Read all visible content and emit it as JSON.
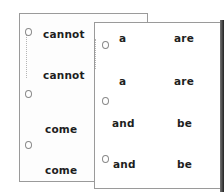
{
  "sheets": {
    "back": {
      "cards": [
        {
          "word": "cannot"
        },
        {
          "word": "cannot"
        },
        {
          "word": "come"
        },
        {
          "word": "come"
        }
      ]
    },
    "front": {
      "cards": [
        {
          "left": "a",
          "right": "are"
        },
        {
          "left": "a",
          "right": "are"
        },
        {
          "left": "and",
          "right": "be"
        },
        {
          "left": "and",
          "right": "be"
        }
      ]
    }
  },
  "colors": {
    "paper": "#ffffff",
    "border": "#9a9a9a",
    "text": "#1e1e1e"
  }
}
